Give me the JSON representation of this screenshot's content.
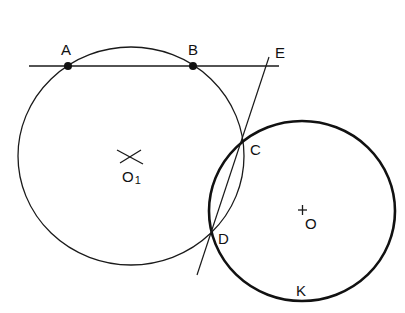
{
  "figure": {
    "colors": {
      "stroke": "#1a1a1a",
      "background": "#ffffff"
    },
    "labels": {
      "A": "A",
      "B": "B",
      "E": "E",
      "C": "C",
      "D": "D",
      "O1_main": "O",
      "O1_sub": "1",
      "O": "O",
      "K": "K"
    },
    "circles": [
      {
        "name": "circle-O1",
        "center": "O1",
        "bold": false
      },
      {
        "name": "circle-O",
        "center": "O",
        "bold": true,
        "marked_point": "K"
      }
    ],
    "points": [
      "A",
      "B",
      "C",
      "D",
      "E",
      "O1",
      "O",
      "K"
    ],
    "lines": [
      "line AB (extended)",
      "line ED (through C and D)"
    ]
  }
}
